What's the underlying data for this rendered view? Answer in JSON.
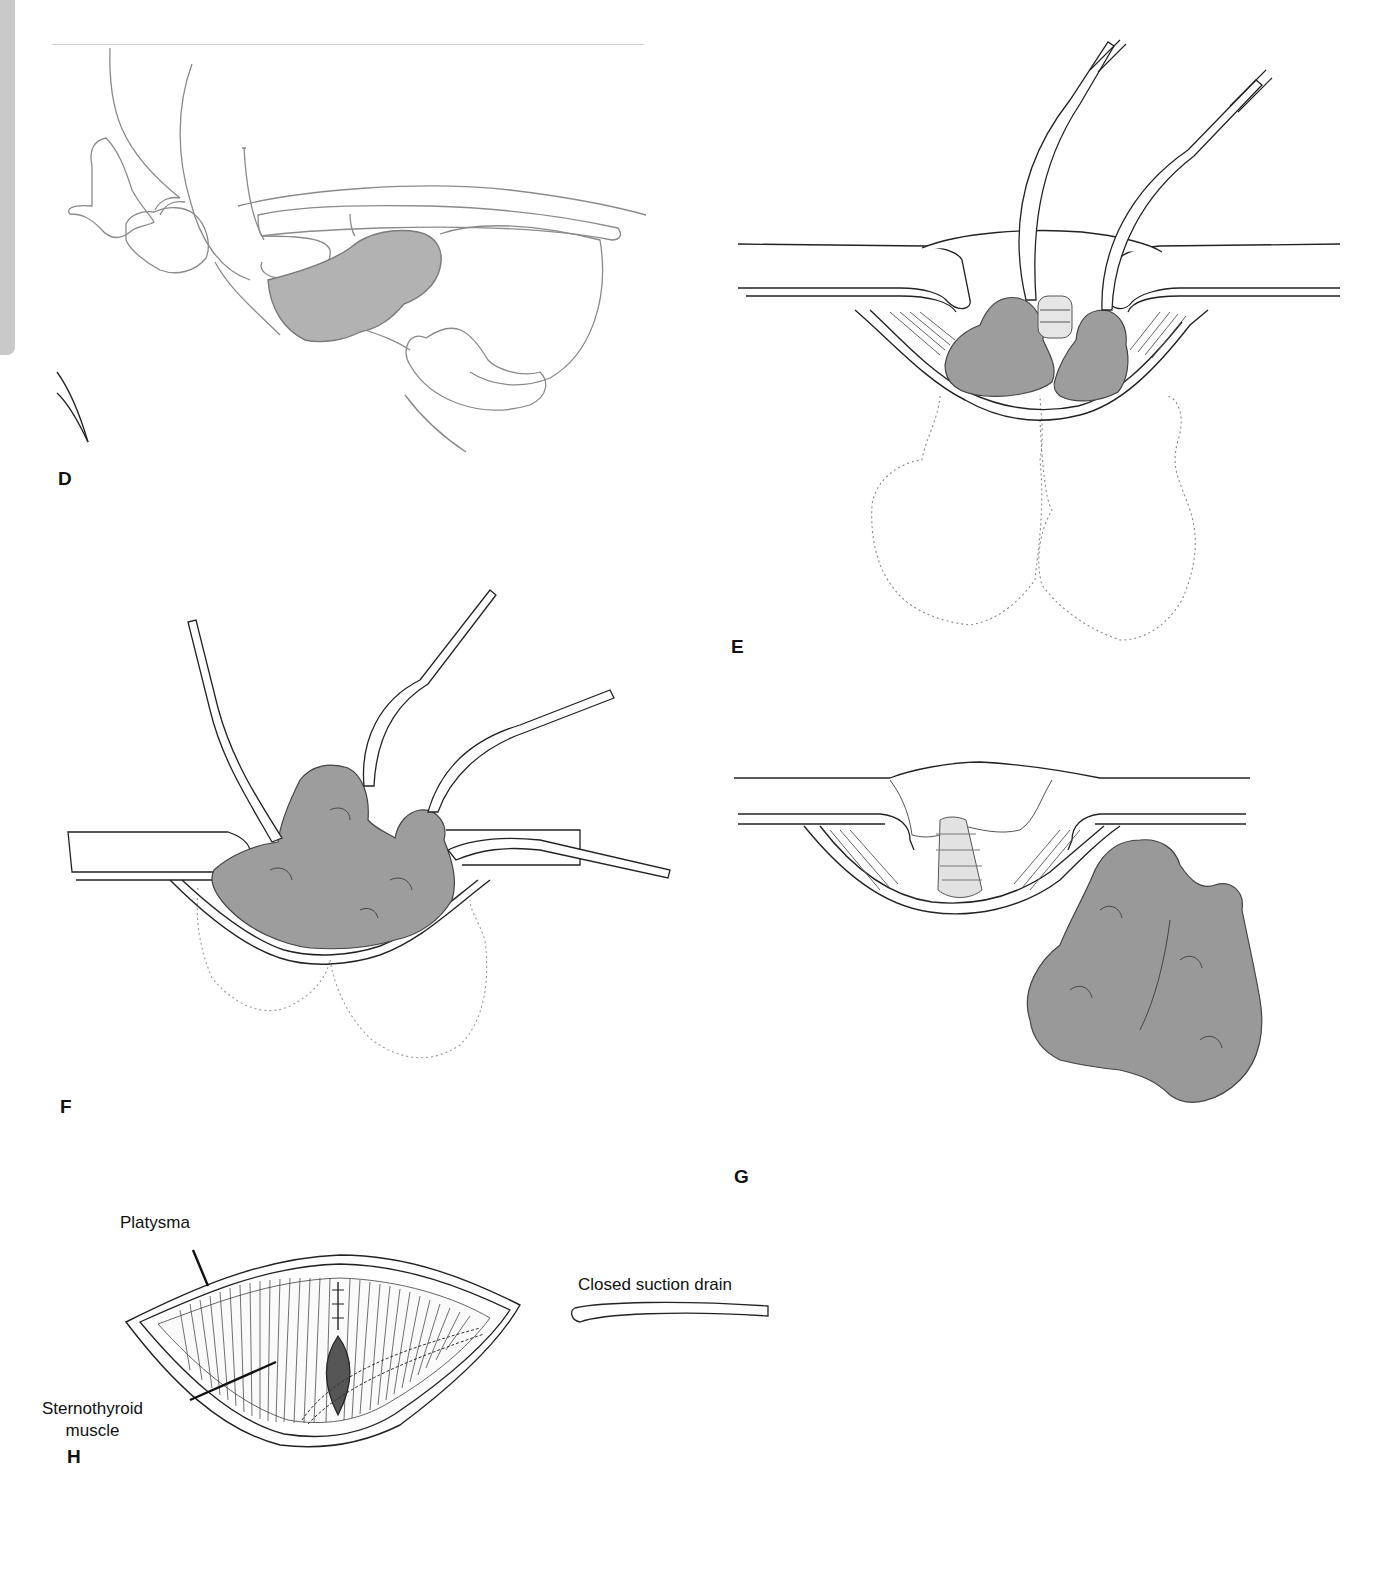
{
  "page": {
    "type": "surgical illustration plate",
    "panels": [
      {
        "id": "D",
        "label": "D",
        "description": "Lateral view of neck anatomy with shaded substernal thyroid mass"
      },
      {
        "id": "E",
        "label": "E",
        "description": "Transverse neck incision with two clamps delivering thyroid lobes; dotted outline shows substernal extent"
      },
      {
        "id": "F",
        "label": "F",
        "description": "Four clamps elevating thyroid mass out of incision; dotted outline shows remaining substernal extent"
      },
      {
        "id": "G",
        "label": "G",
        "description": "Empty thyroid bed showing trachea; resected bilobed thyroid specimen"
      },
      {
        "id": "H",
        "label": "H",
        "description": "Closure of strap muscles with closed suction drain placement"
      }
    ],
    "annotations": {
      "platysma": "Platysma",
      "sternothyroid_line1": "Sternothyroid",
      "sternothyroid_line2": "muscle",
      "drain": "Closed suction drain"
    },
    "colors": {
      "line": "#333333",
      "light_line": "#8a8a8a",
      "tissue_fill": "#9a9a9a",
      "tissue_light": "#b4b4b4",
      "edge_tab": "#c9c9c9",
      "dark_fill": "#555555"
    }
  }
}
